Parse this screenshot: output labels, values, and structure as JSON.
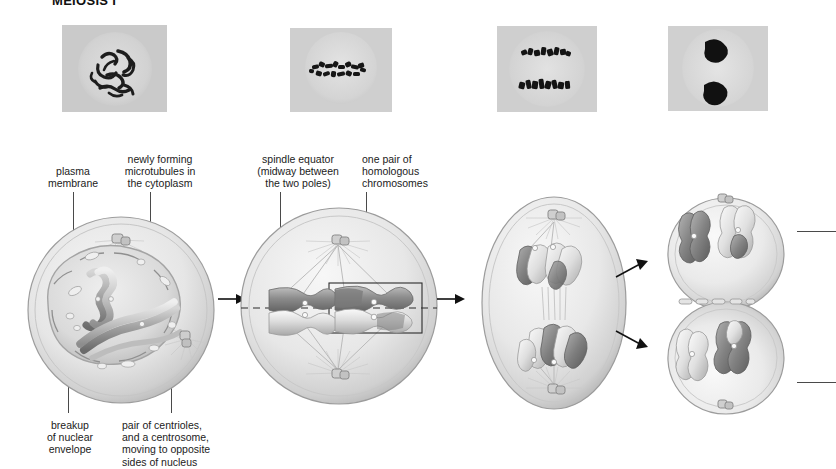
{
  "figure": {
    "title": "MEIOSIS I",
    "type": "biology-process-diagram",
    "stage_count": 4
  },
  "micrographs": [
    {
      "name": "micrograph-prophase-i",
      "caption": "",
      "appearance": "tangled thread-like chromosomes inside round nucleus"
    },
    {
      "name": "micrograph-metaphase-i",
      "caption": "",
      "appearance": "chromosomes aligned in a single band at cell equator"
    },
    {
      "name": "micrograph-anaphase-i",
      "caption": "",
      "appearance": "two separated groups of chromosomes moving apart"
    },
    {
      "name": "micrograph-telophase-i",
      "caption": "",
      "appearance": "two dark condensed chromosome masses at opposite poles"
    }
  ],
  "labels": {
    "top": [
      {
        "id": "plasma-membrane",
        "text": "plasma\nmembrane"
      },
      {
        "id": "newly-forming-microtubules",
        "text": "newly forming\nmicrotubules in\nthe cytoplasm"
      },
      {
        "id": "spindle-equator",
        "text": "spindle equator\n(midway between\nthe two poles)"
      },
      {
        "id": "homologous-pair",
        "text": "one pair of\nhomologous\nchromosomes"
      }
    ],
    "bottom": [
      {
        "id": "nuclear-envelope-breakup",
        "text": "breakup\nof nuclear\nenvelope"
      },
      {
        "id": "centriole-pair",
        "text": "pair of centrioles,\nand a centrosome,\nmoving to opposite\nsides of nucleus"
      }
    ]
  },
  "cells": [
    {
      "id": "cell-prophase-i",
      "shape": "circle",
      "description": "nuclear envelope breaking up, paired chromosomes inside, centrosomes with asters outside"
    },
    {
      "id": "cell-metaphase-i",
      "shape": "circle",
      "description": "bivalents aligned on dashed spindle equator, spindle poles top and bottom, one pair boxed"
    },
    {
      "id": "cell-anaphase-i",
      "shape": "ellipse",
      "description": "elongated cell, homologues pulled toward opposite poles"
    },
    {
      "id": "cell-telophase-i",
      "shape": "two-lobed",
      "description": "cleavage furrow forming between two daughter nuclei each with a haploid set"
    }
  ],
  "annotations": {
    "equator_line_style": "dashed",
    "highlight_box": "rectangle around one homologous pair",
    "arrows": [
      {
        "id": "arrow-1-to-2",
        "direction": "right"
      },
      {
        "id": "arrow-3-to-4-upper",
        "direction": "up-right"
      },
      {
        "id": "arrow-3-to-4-lower",
        "direction": "down-right"
      }
    ],
    "right_leaders": 2
  },
  "colors": {
    "ink": "#1b1b1b",
    "leader": "#4a4a4a",
    "cell_outline": "#9a9a9a",
    "cell_fill": "#e9e9e9",
    "chromosome_dark": "#6e6e6e",
    "chromosome_light": "#dcdcdc",
    "micrograph_bg": "#cdcdcd",
    "background": "#ffffff"
  }
}
